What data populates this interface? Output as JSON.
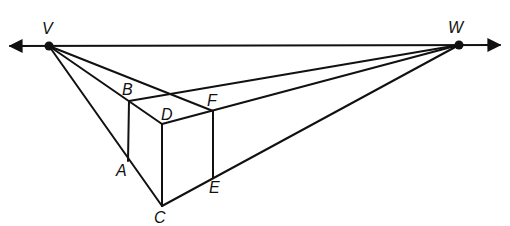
{
  "diagram": {
    "horizon_line": {
      "from_arrow_x": 8,
      "to_arrow_x": 502,
      "y": 46
    },
    "vanishing_points": [
      {
        "label": "V",
        "x": 49,
        "y": 46,
        "label_x": 42,
        "label_y": 21
      },
      {
        "label": "W",
        "x": 459,
        "y": 45,
        "label_x": 448,
        "label_y": 20
      }
    ],
    "points": [
      {
        "label": "B",
        "x": 129,
        "y": 101,
        "label_x": 122,
        "label_y": 82
      },
      {
        "label": "D",
        "x": 162,
        "y": 124,
        "label_x": 161,
        "label_y": 107
      },
      {
        "label": "F",
        "x": 213,
        "y": 111,
        "label_x": 207,
        "label_y": 93
      },
      {
        "label": "A",
        "x": 128,
        "y": 161,
        "label_x": 116,
        "label_y": 163
      },
      {
        "label": "C",
        "x": 162,
        "y": 206,
        "label_x": 154,
        "label_y": 210
      },
      {
        "label": "E",
        "x": 213,
        "y": 178,
        "label_x": 209,
        "label_y": 180
      }
    ],
    "line_color": "#111111"
  }
}
